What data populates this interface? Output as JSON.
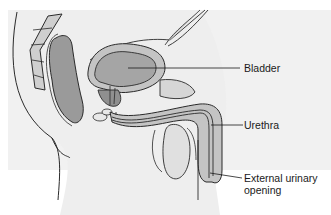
{
  "diagram": {
    "colors": {
      "background": "#ffffff",
      "outline": "#2a2a2a",
      "tissue_dark": "#9a9a9a",
      "tissue_mid": "#b5b5b5",
      "tissue_light": "#d2d2d2",
      "skin_fill": "#ececec"
    },
    "labels": [
      {
        "id": "bladder",
        "text": "Bladder"
      },
      {
        "id": "urethra",
        "text": "Urethra"
      },
      {
        "id": "external-opening-line1",
        "text": "External urinary"
      },
      {
        "id": "external-opening-line2",
        "text": "opening"
      }
    ]
  }
}
